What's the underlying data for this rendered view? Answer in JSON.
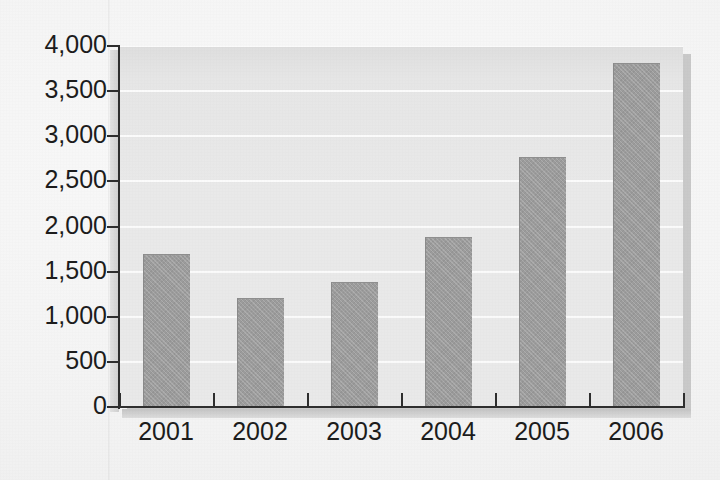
{
  "chart_data": {
    "type": "bar",
    "title": "",
    "subtitle": "",
    "xlabel": "",
    "ylabel": "",
    "categories": [
      "2001",
      "2002",
      "2003",
      "2004",
      "2005",
      "2006"
    ],
    "values": [
      1700,
      1210,
      1380,
      1880,
      2770,
      3810
    ],
    "series": [
      {
        "name": "",
        "values": [
          1700,
          1210,
          1380,
          1880,
          2770,
          3810
        ]
      }
    ],
    "ylim": [
      0,
      4000
    ],
    "ytick_values": [
      0,
      500,
      1000,
      1500,
      2000,
      2500,
      3000,
      3500,
      4000
    ],
    "ytick_labels": [
      "0",
      "500",
      "1,000",
      "1,500",
      "2,000",
      "2,500",
      "3,000",
      "3,500",
      "4,000"
    ],
    "xtick_labels": [
      "2001",
      "2002",
      "2003",
      "2004",
      "2005",
      "2006"
    ],
    "grid": true,
    "grid_axis": "y",
    "legend": false,
    "legend_position": "none",
    "annotations": []
  },
  "style": {
    "bar_color": "#9c9c9c",
    "bar_edge_color": "#8a8a8a",
    "plot_background": "#e9e9e9",
    "page_background": "#f4f4f4",
    "gridline_color": "#fbfbfb",
    "axis_color": "#2e2e2e",
    "shadow_color": "#c9c9c9",
    "text_color": "#1c1c1c"
  }
}
